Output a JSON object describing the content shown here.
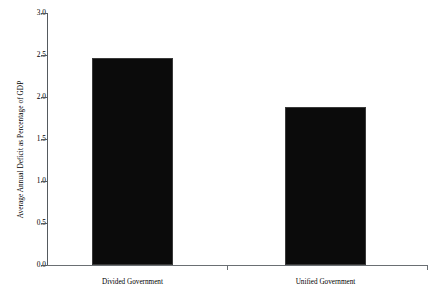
{
  "chart_data": {
    "type": "bar",
    "title": "",
    "subtitle": "",
    "xlabel": "",
    "ylabel": "Average Annual Deficit as Percentage of GDP",
    "categories": [
      "Divided Government",
      "Unified Government"
    ],
    "values": [
      2.47,
      1.88
    ],
    "ylim": [
      0.0,
      3.0
    ],
    "xlim": [
      0,
      2
    ],
    "ytick_labels": [
      "0.0",
      "0.5",
      "1.0",
      "1.5",
      "2.0",
      "2.5",
      "3.0"
    ],
    "ytick_values": [
      0.0,
      0.5,
      1.0,
      1.5,
      2.0,
      2.5,
      3.0
    ],
    "ytick_step": 0.5,
    "grid": false,
    "legend": false,
    "legend_position": "none",
    "bar_color": "#0b0b0b",
    "axis_color": "#555a5e",
    "background_color": "#ffffff",
    "annotations": []
  },
  "axes": {
    "y_title": "Average Annual Deficit as Percentage of GDP",
    "x_tick_marks": [
      "mid",
      "right"
    ]
  }
}
